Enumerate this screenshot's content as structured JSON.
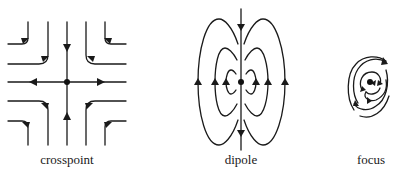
{
  "figure": {
    "panels": [
      {
        "id": "crosspoint",
        "label": "crosspoint",
        "center": [
          67,
          82
        ],
        "description": "Saddle point: flow arrives along vertical axis and leaves along horizontal axis; hyperbolic streamlines in each quadrant."
      },
      {
        "id": "dipole",
        "label": "dipole",
        "center": [
          241,
          82
        ],
        "description": "Dipole: nested closed loops on either side of a vertical axis through the central point; three loops per side."
      },
      {
        "id": "focus",
        "label": "focus",
        "center": [
          370,
          82
        ],
        "description": "Focus: streamlines spiral around a central point."
      }
    ],
    "colors": {
      "stroke": "#1a1a1a",
      "background": "#ffffff"
    }
  }
}
